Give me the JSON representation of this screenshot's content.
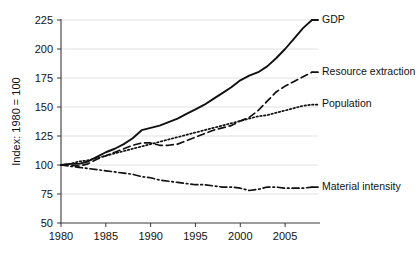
{
  "figure": {
    "cropped_top_caption": "",
    "cropped_bottom_caption": ""
  },
  "chart_data": {
    "type": "line",
    "title": "",
    "subtitle": "",
    "xlabel": "",
    "ylabel": "Index: 1980 = 100",
    "xlim": [
      1980,
      2008
    ],
    "ylim": [
      50,
      225
    ],
    "xticks": [
      1980,
      1985,
      1990,
      1995,
      2000,
      2005
    ],
    "xtick_labels": [
      "1980",
      "1985",
      "1990",
      "1995",
      "2000",
      "2005"
    ],
    "yticks": [
      50,
      75,
      100,
      125,
      150,
      175,
      200,
      225
    ],
    "ytick_labels": [
      "50",
      "75",
      "100",
      "125",
      "150",
      "175",
      "200",
      "225"
    ],
    "grid": "horizontal",
    "legend_position": "right-inline-labels",
    "x": [
      1980,
      1981,
      1982,
      1983,
      1984,
      1985,
      1986,
      1987,
      1988,
      1989,
      1990,
      1991,
      1992,
      1993,
      1994,
      1995,
      1996,
      1997,
      1998,
      1999,
      2000,
      2001,
      2002,
      2003,
      2004,
      2005,
      2006,
      2007,
      2008
    ],
    "series": [
      {
        "name": "GDP",
        "label": "GDP",
        "style": "solid",
        "color": "#111111",
        "values": [
          100,
          101,
          101,
          103,
          107,
          111,
          114,
          118,
          123,
          130,
          132,
          134,
          137,
          140,
          144,
          148,
          152,
          157,
          162,
          167,
          173,
          177,
          180,
          185,
          192,
          200,
          209,
          218,
          225
        ]
      },
      {
        "name": "Resource extraction",
        "label": "Resource extraction",
        "style": "dashed",
        "color": "#111111",
        "values": [
          100,
          100,
          99,
          101,
          105,
          108,
          111,
          114,
          117,
          119,
          119,
          117,
          117,
          118,
          121,
          124,
          127,
          130,
          132,
          134,
          138,
          141,
          147,
          155,
          163,
          168,
          172,
          176,
          180
        ]
      },
      {
        "name": "Population",
        "label": "Population",
        "style": "dotted",
        "color": "#111111",
        "values": [
          100,
          101,
          103,
          104,
          106,
          108,
          110,
          112,
          114,
          116,
          118,
          120,
          122,
          124,
          126,
          128,
          130,
          132,
          134,
          136,
          138,
          140,
          142,
          143,
          145,
          147,
          149,
          151,
          152
        ]
      },
      {
        "name": "Material intensity",
        "label": "Material intensity",
        "style": "dash-dot",
        "color": "#111111",
        "values": [
          100,
          99,
          98,
          97,
          96,
          95,
          94,
          93,
          92,
          90,
          89,
          87,
          86,
          85,
          84,
          83,
          83,
          82,
          81,
          81,
          80,
          78,
          79,
          81,
          81,
          80,
          80,
          80,
          81
        ]
      }
    ]
  }
}
